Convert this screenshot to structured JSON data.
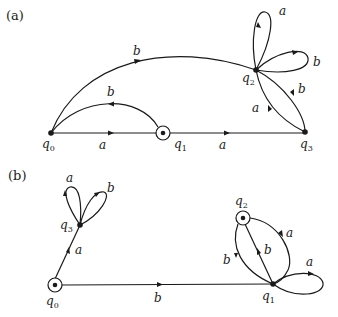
{
  "diagram_a": {
    "panel_label": "(a)",
    "states": [
      {
        "id": "q0",
        "name": "q",
        "sub": "0",
        "accepting": false
      },
      {
        "id": "q1",
        "name": "q",
        "sub": "1",
        "accepting": true
      },
      {
        "id": "q2",
        "name": "q",
        "sub": "2",
        "accepting": false
      },
      {
        "id": "q3",
        "name": "q",
        "sub": "3",
        "accepting": false
      }
    ],
    "transitions": [
      {
        "from": "q0",
        "to": "q1",
        "symbol": "a"
      },
      {
        "from": "q1",
        "to": "q3",
        "symbol": "a"
      },
      {
        "from": "q1",
        "to": "q0",
        "symbol": "b"
      },
      {
        "from": "q0",
        "to": "q2",
        "symbol": "b"
      },
      {
        "from": "q2",
        "to": "q2",
        "symbol": "a"
      },
      {
        "from": "q2",
        "to": "q2",
        "symbol": "b"
      },
      {
        "from": "q2",
        "to": "q3",
        "symbol": "b"
      },
      {
        "from": "q3",
        "to": "q2",
        "symbol": "a"
      }
    ]
  },
  "diagram_b": {
    "panel_label": "(b)",
    "states": [
      {
        "id": "q0",
        "name": "q",
        "sub": "0",
        "accepting": true
      },
      {
        "id": "q1",
        "name": "q",
        "sub": "1",
        "accepting": false
      },
      {
        "id": "q2",
        "name": "q",
        "sub": "2",
        "accepting": true
      },
      {
        "id": "q3",
        "name": "q",
        "sub": "3",
        "accepting": false
      }
    ],
    "transitions": [
      {
        "from": "q0",
        "to": "q3",
        "symbol": "a"
      },
      {
        "from": "q0",
        "to": "q1",
        "symbol": "b"
      },
      {
        "from": "q3",
        "to": "q3",
        "symbol": "a"
      },
      {
        "from": "q3",
        "to": "q3",
        "symbol": "b"
      },
      {
        "from": "q2",
        "to": "q1",
        "symbol": "a"
      },
      {
        "from": "q2",
        "to": "q1",
        "symbol": "b"
      },
      {
        "from": "q1",
        "to": "q2",
        "symbol": "b"
      },
      {
        "from": "q1",
        "to": "q1",
        "symbol": "a"
      }
    ]
  }
}
